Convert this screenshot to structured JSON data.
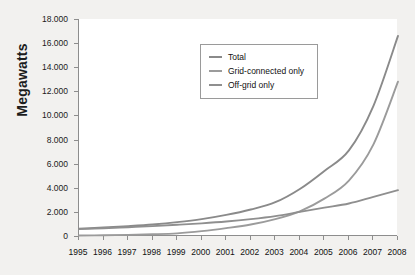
{
  "chart_data": {
    "type": "line",
    "title": "",
    "xlabel": "",
    "ylabel": "Megawatts",
    "x": [
      1995,
      1996,
      1997,
      1998,
      1999,
      2000,
      2001,
      2002,
      2003,
      2004,
      2005,
      2006,
      2007,
      2008
    ],
    "xtick_labels": [
      "1995",
      "1996",
      "1997",
      "1998",
      "1999",
      "2000",
      "2001",
      "2002",
      "2003",
      "2004",
      "2005",
      "2006",
      "2007",
      "2008"
    ],
    "ytick_labels": [
      "0",
      "2.000",
      "4.000",
      "6.000",
      "8.000",
      "10.000",
      "12.000",
      "14.000",
      "16.000",
      "18.000"
    ],
    "ytick_values": [
      0,
      2000,
      4000,
      6000,
      8000,
      10000,
      12000,
      14000,
      16000,
      18000
    ],
    "ylim": [
      0,
      18000
    ],
    "xlim": [
      1995,
      2008
    ],
    "grid": false,
    "legend_position": "upper-center",
    "series": [
      {
        "name": "Total",
        "color": "#8a8a8a",
        "values": [
          610,
          700,
          820,
          960,
          1150,
          1400,
          1750,
          2200,
          2800,
          3900,
          5400,
          7100,
          10800,
          16600
        ]
      },
      {
        "name": "Grid-connected only",
        "color": "#9b9b9b",
        "values": [
          40,
          60,
          90,
          140,
          220,
          400,
          650,
          950,
          1400,
          2050,
          3100,
          4600,
          7600,
          12800
        ]
      },
      {
        "name": "Off-grid only",
        "color": "#8f8f8f",
        "values": [
          570,
          640,
          730,
          820,
          930,
          1050,
          1200,
          1400,
          1650,
          2000,
          2350,
          2700,
          3250,
          3800
        ]
      }
    ]
  },
  "legend": {
    "items": [
      {
        "label": "Total"
      },
      {
        "label": "Grid-connected only"
      },
      {
        "label": "Off-grid only"
      }
    ]
  },
  "axis": {
    "y_title": "Megawatts"
  },
  "colors": {
    "axis_line": "#8d8d8d",
    "plot_background": "#ffffff",
    "page_background": "#f2f1ef",
    "text": "#1b1b1b"
  }
}
